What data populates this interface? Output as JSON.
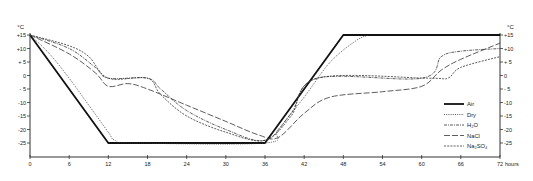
{
  "chart_data": {
    "type": "line",
    "title": "",
    "xlabel": "hours",
    "ylabel": "°C",
    "xlim": [
      0,
      72
    ],
    "ylim": [
      -30,
      15
    ],
    "x_ticks": [
      0,
      6,
      12,
      18,
      24,
      30,
      36,
      42,
      48,
      54,
      60,
      66,
      72
    ],
    "x_tick_labels": [
      "0",
      "6",
      "12",
      "18",
      "24",
      "30",
      "36",
      "42",
      "48",
      "54",
      "60",
      "66",
      "72"
    ],
    "y_ticks": [
      15,
      10,
      5,
      0,
      -5,
      -10,
      -15,
      -20,
      -25
    ],
    "y_tick_labels_left": [
      "+15",
      "+10",
      "+ 5",
      "0",
      "- 5",
      "-10",
      "-15",
      "-20",
      "-25"
    ],
    "y_tick_labels_right": [
      "+15",
      "+10",
      "+ 5",
      "0",
      "- 5",
      "-10",
      "-15",
      "-20",
      "-25"
    ],
    "y_unit_left": "°C",
    "y_unit_right": "°C",
    "x_unit": "hours",
    "grid": false,
    "legend_position": "lower right",
    "series": [
      {
        "name": "Air",
        "style": "thick-solid",
        "x": [
          0,
          12,
          36,
          48,
          72
        ],
        "values": [
          15,
          -25,
          -25,
          15,
          15
        ]
      },
      {
        "name": "Dry",
        "style": "dotted",
        "x": [
          0,
          3,
          6,
          9,
          12,
          13,
          16,
          36,
          38,
          42,
          46,
          50,
          52
        ],
        "values": [
          15,
          8,
          -1,
          -11,
          -21,
          -24,
          -25,
          -25,
          -20,
          -8,
          5,
          13,
          15
        ]
      },
      {
        "name": "H2O",
        "label_display": "H₂O",
        "style": "dash-dot",
        "x": [
          0,
          6,
          10,
          12,
          18,
          20,
          24,
          30,
          36,
          40,
          44,
          60,
          63,
          66,
          72
        ],
        "values": [
          15,
          10,
          3,
          -1,
          -1,
          -5,
          -13,
          -20,
          -24,
          -14,
          -1,
          -1,
          7,
          9,
          10
        ]
      },
      {
        "name": "NaCl",
        "style": "long-dash",
        "x": [
          0,
          6,
          10,
          12,
          15,
          18,
          24,
          30,
          35,
          38,
          42,
          46,
          54,
          60,
          63,
          66,
          72
        ],
        "values": [
          15,
          8,
          1,
          -4,
          -3,
          -5,
          -11,
          -17,
          -22,
          -23,
          -14,
          -8,
          -6,
          -4,
          2,
          6,
          12
        ]
      },
      {
        "name": "Na2SO4",
        "label_display": "Na₂SO₄",
        "style": "short-dash",
        "x": [
          0,
          6,
          9,
          12,
          18,
          20,
          24,
          30,
          36,
          40,
          44,
          61,
          64,
          66,
          72
        ],
        "values": [
          15,
          11,
          7,
          -1,
          -1,
          -7,
          -15,
          -21,
          -24,
          -15,
          -1,
          -1,
          -1,
          3,
          7
        ]
      }
    ]
  },
  "legend": {
    "items": [
      {
        "label": "Air"
      },
      {
        "label": "Dry"
      },
      {
        "label": "H₂O"
      },
      {
        "label": "NaCl"
      },
      {
        "label": "Na₂SO₄"
      }
    ]
  }
}
